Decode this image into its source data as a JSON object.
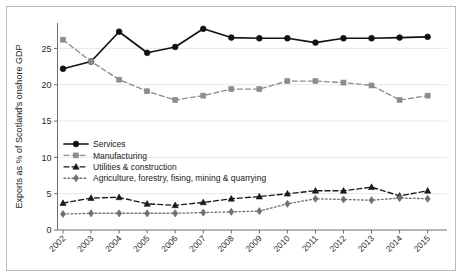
{
  "chart_data": {
    "type": "line",
    "title": "",
    "xlabel": "",
    "ylabel": "Exports as % of Scotland's onshore GDP",
    "x": [
      "2002",
      "2003",
      "2004",
      "2005",
      "2006",
      "2007",
      "2008",
      "2009",
      "2010",
      "2011",
      "2012",
      "2013",
      "2014",
      "2015"
    ],
    "categories": [
      "2002",
      "2003",
      "2004",
      "2005",
      "2006",
      "2007",
      "2008",
      "2009",
      "2010",
      "2011",
      "2012",
      "2013",
      "2014",
      "2015"
    ],
    "ylim": [
      0,
      28.5
    ],
    "yticks": [
      0,
      5,
      10,
      15,
      20,
      25
    ],
    "ytick_labels": [
      "0",
      "5",
      "10",
      "15",
      "20",
      "25"
    ],
    "grid": true,
    "legend_position": "center-left",
    "series": [
      {
        "name": "Services",
        "color": "#111111",
        "linestyle": "solid",
        "marker": "circle",
        "values": [
          22.2,
          23.2,
          27.3,
          24.4,
          25.2,
          27.7,
          26.5,
          26.4,
          26.4,
          25.8,
          26.4,
          26.4,
          26.5,
          26.6
        ]
      },
      {
        "name": "Manufacturing",
        "color": "#8c8c8c",
        "linestyle": "dashed",
        "marker": "square",
        "values": [
          26.2,
          23.2,
          20.7,
          19.1,
          17.9,
          18.5,
          19.4,
          19.4,
          20.5,
          20.5,
          20.3,
          19.9,
          17.9,
          18.5
        ]
      },
      {
        "name": "Utilities & construction",
        "color": "#1a1a1a",
        "linestyle": "dashed",
        "marker": "triangle",
        "values": [
          3.7,
          4.4,
          4.5,
          3.6,
          3.4,
          3.8,
          4.3,
          4.6,
          5.0,
          5.4,
          5.4,
          5.9,
          4.7,
          5.4
        ]
      },
      {
        "name": "Agriculture, forestry, fising, mining & quarrying",
        "color": "#707070",
        "linestyle": "dotted",
        "marker": "diamond",
        "values": [
          2.2,
          2.3,
          2.3,
          2.3,
          2.3,
          2.4,
          2.5,
          2.6,
          3.6,
          4.3,
          4.2,
          4.1,
          4.4,
          4.3
        ]
      }
    ]
  },
  "legend": {
    "items": [
      {
        "label": "Services"
      },
      {
        "label": "Manufacturing"
      },
      {
        "label": "Utilities & construction"
      },
      {
        "label": "Agriculture, forestry, fising, mining & quarrying"
      }
    ]
  },
  "axes": {
    "y_title": "Exports as % of Scotland's onshore GDP"
  }
}
